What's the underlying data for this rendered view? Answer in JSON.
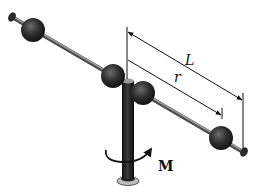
{
  "diagram": {
    "labels": {
      "length_outer": "L",
      "length_inner": "r",
      "torque": "M"
    },
    "colors": {
      "sphere": "#2a2a2a",
      "rod": "#6e6e6e",
      "post": "#1e1e1e",
      "dimension_line": "#111111",
      "background": "#ffffff"
    }
  }
}
